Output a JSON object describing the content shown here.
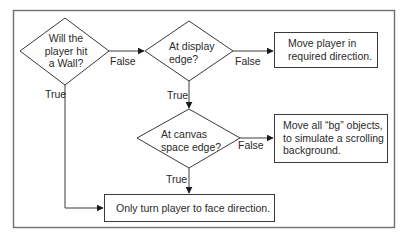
{
  "diagram": {
    "type": "flowchart",
    "decisions": [
      {
        "id": "d1",
        "lines": [
          "Will the",
          "player hit",
          "a Wall?"
        ]
      },
      {
        "id": "d2",
        "lines": [
          "At display",
          "edge?"
        ]
      },
      {
        "id": "d3",
        "lines": [
          "At canvas",
          "space edge?"
        ]
      }
    ],
    "processes": [
      {
        "id": "p1",
        "lines": [
          "Move player in",
          "required direction."
        ]
      },
      {
        "id": "p2",
        "lines": [
          "Move all “bg” objects,",
          "to simulate a scrolling",
          "background."
        ]
      },
      {
        "id": "p3",
        "lines": [
          "Only turn player to face direction."
        ]
      }
    ],
    "edge_labels": {
      "d1_false": "False",
      "d1_true": "True",
      "d2_false": "False",
      "d2_true": "True",
      "d3_false": "False",
      "d3_true": "True"
    },
    "edges": [
      {
        "from": "d1",
        "to": "d2",
        "label": "False"
      },
      {
        "from": "d1",
        "to": "p3",
        "label": "True"
      },
      {
        "from": "d2",
        "to": "p1",
        "label": "False"
      },
      {
        "from": "d2",
        "to": "d3",
        "label": "True"
      },
      {
        "from": "d3",
        "to": "p2",
        "label": "False"
      },
      {
        "from": "d3",
        "to": "p3",
        "label": "True"
      }
    ],
    "colors": {
      "stroke": "#3a3a3a",
      "frame": "#6e6e6e",
      "text": "#2a2a2a",
      "background": "#ffffff"
    }
  }
}
